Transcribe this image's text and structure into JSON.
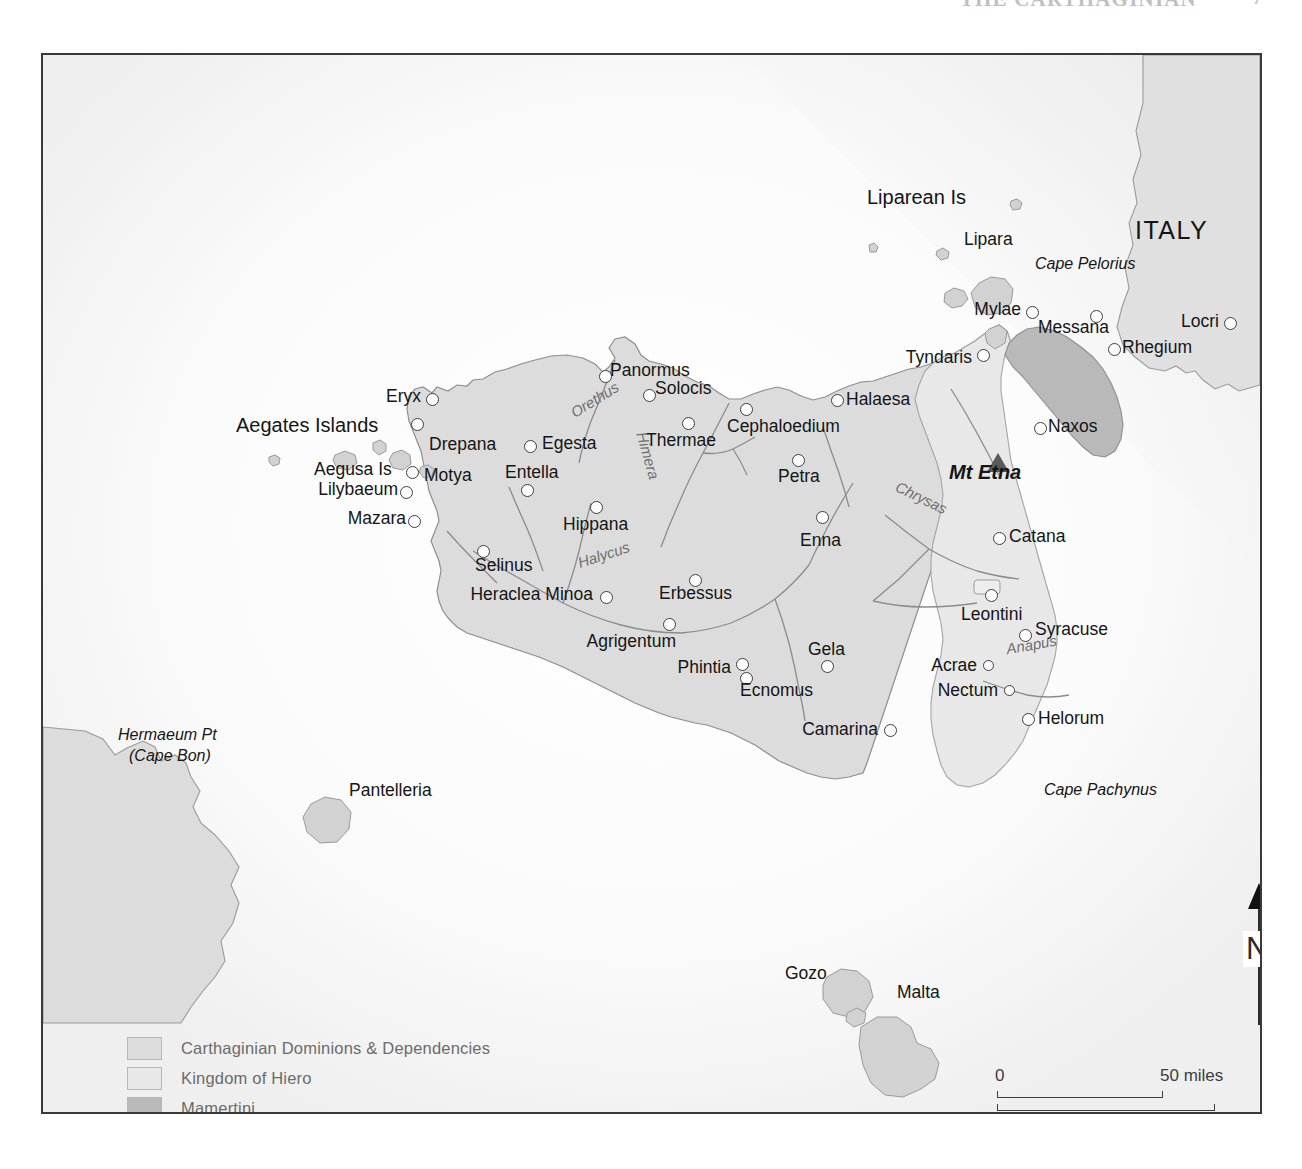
{
  "page_header": {
    "title": "THE CARTHAGINIAN",
    "folio": "7"
  },
  "map": {
    "regions": [
      {
        "name": "ITALY",
        "label": "ITALY"
      }
    ],
    "legend": {
      "items": [
        {
          "label": "Carthaginian Dominions & Dependencies",
          "color": "#dcdcdc"
        },
        {
          "label": "Kingdom of Hiero",
          "color": "#e8e8e8"
        },
        {
          "label": "Mamertini",
          "color": "#b9b9b9"
        }
      ]
    },
    "scale": {
      "miles_start": "0",
      "miles_end": "50 miles",
      "km_start": "0",
      "km_end": "100 km"
    },
    "north_arrow": {
      "letter": "N"
    },
    "cities": [
      {
        "label": "Eryx",
        "x": 430,
        "y": 396,
        "lx": 400,
        "ly": 388,
        "anchor": "right"
      },
      {
        "label": "Drepana",
        "x": 415,
        "y": 421,
        "lx": 425,
        "ly": 436,
        "anchor": "left"
      },
      {
        "label": "Motya",
        "x": 410,
        "y": 469,
        "lx": 420,
        "ly": 468,
        "anchor": "left"
      },
      {
        "label": "Lilybaeum",
        "x": 404,
        "y": 489,
        "lx": 396,
        "ly": 482,
        "anchor": "right"
      },
      {
        "label": "Mazara",
        "x": 412,
        "y": 518,
        "lx": 404,
        "ly": 511,
        "anchor": "right"
      },
      {
        "label": "Egesta",
        "x": 528,
        "y": 443,
        "lx": 540,
        "ly": 440,
        "anchor": "left"
      },
      {
        "label": "Entella",
        "x": 525,
        "y": 487,
        "lx": 501,
        "ly": 468,
        "anchor": "left"
      },
      {
        "label": "Hippana",
        "x": 594,
        "y": 504,
        "lx": 562,
        "ly": 512,
        "anchor": "left"
      },
      {
        "label": "Selinus",
        "x": 481,
        "y": 548,
        "lx": 473,
        "ly": 556,
        "anchor": "left"
      },
      {
        "label": "Heraclea Minoa",
        "x": 604,
        "y": 594,
        "lx": 596,
        "ly": 587,
        "anchor": "right"
      },
      {
        "label": "Agrigentum",
        "x": 667,
        "y": 621,
        "lx": 646,
        "ly": 629,
        "anchor": "right"
      },
      {
        "label": "Phintia",
        "x": 740,
        "y": 661,
        "lx": 731,
        "ly": 662,
        "anchor": "right"
      },
      {
        "label": "Ecnomus",
        "x": 744,
        "y": 675,
        "lx": 739,
        "ly": 677,
        "anchor": "right"
      },
      {
        "label": "Erbessus",
        "x": 693,
        "y": 577,
        "lx": 665,
        "ly": 586,
        "anchor": "left"
      },
      {
        "label": "Panormus",
        "x": 603,
        "y": 373,
        "lx": 614,
        "ly": 363,
        "anchor": "left"
      },
      {
        "label": "Solocis",
        "x": 647,
        "y": 392,
        "lx": 659,
        "ly": 378,
        "anchor": "left"
      },
      {
        "label": "Thermae",
        "x": 686,
        "y": 420,
        "lx": 651,
        "ly": 428,
        "anchor": "left"
      },
      {
        "label": "Cephaloedium",
        "x": 744,
        "y": 406,
        "lx": 732,
        "ly": 414,
        "anchor": "left"
      },
      {
        "label": "Halaesa",
        "x": 835,
        "y": 397,
        "lx": 847,
        "ly": 395,
        "anchor": "left"
      },
      {
        "label": "Petra",
        "x": 796,
        "y": 457,
        "lx": 781,
        "ly": 466,
        "anchor": "left"
      },
      {
        "label": "Enna",
        "x": 820,
        "y": 514,
        "lx": 803,
        "ly": 530,
        "anchor": "left"
      },
      {
        "label": "Gela",
        "x": 825,
        "y": 663,
        "lx": 810,
        "ly": 645,
        "anchor": "left"
      },
      {
        "label": "Camarina",
        "x": 888,
        "y": 727,
        "lx": 879,
        "ly": 721,
        "anchor": "right"
      },
      {
        "label": "Tyndaris",
        "x": 981,
        "y": 352,
        "lx": 972,
        "ly": 351,
        "anchor": "right"
      },
      {
        "label": "Mylae",
        "x": 1030,
        "y": 309,
        "lx": 1021,
        "ly": 303,
        "anchor": "right"
      },
      {
        "label": "Messana",
        "x": 1094,
        "y": 313,
        "lx": 1085,
        "ly": 320,
        "anchor": "right"
      },
      {
        "label": "Naxos",
        "x": 1038,
        "y": 425,
        "lx": 1050,
        "ly": 418,
        "anchor": "left"
      },
      {
        "label": "Catana",
        "x": 997,
        "y": 535,
        "lx": 1009,
        "ly": 528,
        "anchor": "left"
      },
      {
        "label": "Leontini",
        "x": 989,
        "y": 592,
        "lx": 963,
        "ly": 605,
        "anchor": "left"
      },
      {
        "label": "Syracuse",
        "x": 1023,
        "y": 632,
        "lx": 1035,
        "ly": 621,
        "anchor": "left"
      },
      {
        "label": "Acrae",
        "x": 986,
        "y": 662,
        "lx": 977,
        "ly": 655,
        "anchor": "right"
      },
      {
        "label": "Nectum",
        "x": 1007,
        "y": 687,
        "lx": 998,
        "ly": 680,
        "anchor": "right"
      },
      {
        "label": "Helorum",
        "x": 1026,
        "y": 716,
        "lx": 1038,
        "ly": 711,
        "anchor": "left"
      },
      {
        "label": "Rhegium",
        "x": 1112,
        "y": 346,
        "lx": 1124,
        "ly": 340,
        "anchor": "left"
      },
      {
        "label": "Locri",
        "x": 1228,
        "y": 320,
        "lx": 1219,
        "ly": 314,
        "anchor": "right"
      }
    ],
    "islands": [
      {
        "label": "Liparean Is",
        "x": 866,
        "y": 194,
        "size": "islandgrp"
      },
      {
        "label": "Lipara",
        "x": 963,
        "y": 236,
        "size": "island"
      },
      {
        "label": "Aegates Islands",
        "x": 235,
        "y": 419,
        "size": "islandgrp"
      },
      {
        "label": "Aegusa Is",
        "x": 313,
        "y": 465,
        "size": "island"
      },
      {
        "label": "Pantelleria",
        "x": 348,
        "y": 786,
        "size": "island"
      },
      {
        "label": "Gozo",
        "x": 784,
        "y": 969,
        "size": "island"
      },
      {
        "label": "Malta",
        "x": 896,
        "y": 988,
        "size": "island"
      }
    ],
    "physical": [
      {
        "label": "Cape Pelorius",
        "x": 1034,
        "y": 260,
        "type": "cape"
      },
      {
        "label": "Cape Pachynus",
        "x": 1043,
        "y": 786,
        "type": "cape"
      },
      {
        "label": "Mt Etna",
        "x": 948,
        "y": 466,
        "type": "peak"
      },
      {
        "label": "Hermaeum Pt",
        "x": 117,
        "y": 731,
        "type": "cape"
      },
      {
        "label": "(Cape Bon)",
        "x": 128,
        "y": 752,
        "type": "cape"
      }
    ],
    "rivers": [
      {
        "label": "Orethus",
        "x": 567,
        "y": 396,
        "rot": -32
      },
      {
        "label": "Himera",
        "x": 623,
        "y": 452,
        "rot": 74
      },
      {
        "label": "Halycus",
        "x": 576,
        "y": 551,
        "rot": -18
      },
      {
        "label": "Chrysas",
        "x": 893,
        "y": 494,
        "rot": 26
      },
      {
        "label": "Anapus",
        "x": 1005,
        "y": 641,
        "rot": -10
      }
    ]
  }
}
